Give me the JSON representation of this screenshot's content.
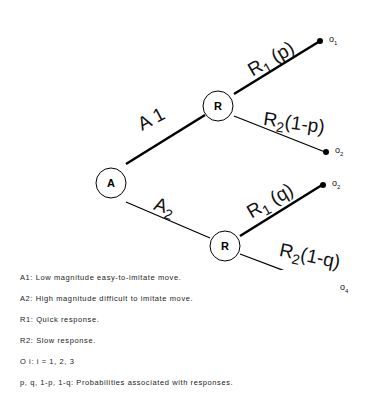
{
  "diagram": {
    "type": "decision-tree",
    "nodes": {
      "root": {
        "label": "A"
      },
      "upper_response": {
        "label": "R"
      },
      "lower_response": {
        "label": "R"
      }
    },
    "edges": {
      "a1": {
        "label": "A 1"
      },
      "a2": {
        "label": "A",
        "sub": "2"
      },
      "r1_upper": {
        "label": "R",
        "sub": "1",
        "suffix": " (p)"
      },
      "r2_upper": {
        "label": "R",
        "sub": "2",
        "suffix": "(1-p)"
      },
      "r1_lower": {
        "label": "R",
        "sub": "1",
        "suffix": " (q)"
      },
      "r2_lower": {
        "label": "R",
        "sub": "2",
        "suffix": "(1-q)"
      }
    },
    "outcomes": [
      {
        "label": "o",
        "sub": "1"
      },
      {
        "label": "o",
        "sub": "2"
      },
      {
        "label": "o",
        "sub": "2"
      },
      {
        "label": "o",
        "sub": "4"
      }
    ]
  },
  "legend": [
    "A1: Low magnitude easy-to-imitate move.",
    "A2: High magnitude difficult to imitate move.",
    "R1: Quick response.",
    "R2: Slow response.",
    "O i: i = 1, 2, 3",
    "p, q, 1-p, 1-q: Probabilities associated with responses."
  ]
}
